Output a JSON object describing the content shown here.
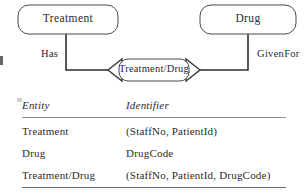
{
  "diagram": {
    "entities": [
      {
        "id": "treatment",
        "label": "Treatment"
      },
      {
        "id": "drug",
        "label": "Drug"
      }
    ],
    "associative_entity": {
      "id": "treatment-drug",
      "label": "Treatment/Drug"
    },
    "relationships": [
      {
        "id": "has",
        "label": "Has"
      },
      {
        "id": "givenfor",
        "label": "GivenFor"
      }
    ],
    "colors": {
      "stroke": "#3a3a3a",
      "connector": "#2e2e2e",
      "text": "#2b2b2b",
      "background": "#ffffff"
    }
  },
  "table": {
    "headers": {
      "entity": "Entity",
      "identifier": "Identifier"
    },
    "rows": [
      {
        "entity": "Treatment",
        "identifier": "(StaffNo,  PatientId)"
      },
      {
        "entity": "Drug",
        "identifier": "DrugCode"
      },
      {
        "entity": "Treatment/Drug",
        "identifier": "(StaffNo,  PatientId,  DrugCode)"
      }
    ]
  }
}
